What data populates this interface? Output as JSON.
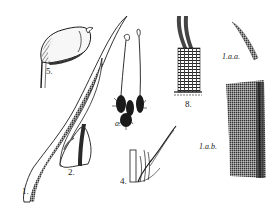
{
  "plate": {
    "subject": "moss botanical illustration",
    "ink_color": "#1a1a1a",
    "background": "#ffffff",
    "figures": [
      {
        "id": "fig5",
        "label": "5.",
        "description": "capsule"
      },
      {
        "id": "fig1",
        "label": "1.",
        "description": "leaf"
      },
      {
        "id": "fig2",
        "label": "2.",
        "description": "leaf base"
      },
      {
        "id": "figa",
        "label": "a.",
        "description": "whole plant with setae"
      },
      {
        "id": "fig8",
        "label": "8.",
        "description": "peristome tooth"
      },
      {
        "id": "fig1aa",
        "label": "1.a.a.",
        "description": "leaf apex detail"
      },
      {
        "id": "fig1ab",
        "label": "1.a.b.",
        "description": "leaf cell detail"
      },
      {
        "id": "fig4",
        "label": "4.",
        "description": "perichaetial leaves"
      }
    ]
  }
}
